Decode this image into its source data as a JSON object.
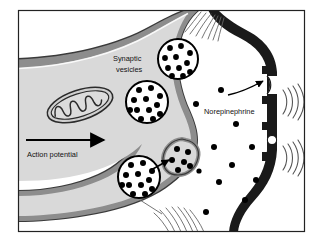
{
  "figure": {
    "panel_label": "c",
    "title_description": "Synaptic transmission at an adrenergic synapse",
    "frame": {
      "x": 18,
      "y": 10,
      "width": 287,
      "height": 222,
      "border_color": "#222222"
    },
    "background_color": "#ffffff"
  },
  "labels": {
    "synaptic_vesicles_line1": "Synaptic",
    "synaptic_vesicles_line2": "vesicles",
    "norepinephrine": "Norepinephrine",
    "action_potential": "Action potential"
  },
  "colors": {
    "cytoplasm": "#d9d9d9",
    "presynaptic_membrane": "#8d8d8d",
    "membrane_outline": "#3a3a3a",
    "postsynaptic_membrane": "#1a1a1a",
    "vesicle_fill": "#ffffff",
    "vesicle_outline": "#000000",
    "neurotransmitter_dot": "#000000",
    "cleft": "#ffffff",
    "text": "#111111"
  },
  "structures": {
    "presynaptic_terminal": {
      "name": "axon-terminal",
      "description": "Bulb-shaped presynaptic axon terminal with gray cytoplasm"
    },
    "mitochondrion": {
      "name": "mitochondrion",
      "cx": 80,
      "cy": 105,
      "rx": 34,
      "ry": 15,
      "rotation": -18,
      "cristae_count": 6
    },
    "synaptic_cleft": {
      "name": "synaptic-cleft",
      "description": "White gap between presynaptic terminal and postsynaptic membrane"
    },
    "postsynaptic_membrane": {
      "name": "postsynaptic-membrane",
      "thickness": 7,
      "receptor_count": 2
    }
  },
  "vesicles": [
    {
      "id": "vesicle-top",
      "cx": 178,
      "cy": 59,
      "r": 20,
      "granule_count": 11,
      "state": "docked-upper"
    },
    {
      "id": "vesicle-middle",
      "cx": 147,
      "cy": 102,
      "r": 21,
      "granule_count": 12,
      "state": "free"
    },
    {
      "id": "vesicle-lower",
      "cx": 139,
      "cy": 177,
      "r": 21,
      "granule_count": 12,
      "state": "free"
    },
    {
      "id": "vesicle-fusing",
      "cx": 184,
      "cy": 158,
      "r": 14,
      "granule_count": 6,
      "state": "fusing-with-membrane"
    }
  ],
  "neurotransmitter_dots": [
    {
      "cx": 196,
      "cy": 104,
      "r": 3.0
    },
    {
      "cx": 221,
      "cy": 90,
      "r": 3.0
    },
    {
      "cx": 236,
      "cy": 124,
      "r": 3.0
    },
    {
      "cx": 214,
      "cy": 147,
      "r": 3.0
    },
    {
      "cx": 252,
      "cy": 147,
      "r": 3.0
    },
    {
      "cx": 232,
      "cy": 165,
      "r": 3.0
    },
    {
      "cx": 256,
      "cy": 180,
      "r": 3.0
    },
    {
      "cx": 219,
      "cy": 182,
      "r": 3.0
    },
    {
      "cx": 245,
      "cy": 200,
      "r": 3.0
    },
    {
      "cx": 206,
      "cy": 212,
      "r": 3.0
    },
    {
      "cx": 199,
      "cy": 171,
      "r": 2.6
    }
  ],
  "receptors": [
    {
      "id": "receptor-upper",
      "cx": 275,
      "cy": 85,
      "label": "receptor-binding-site"
    },
    {
      "id": "receptor-lower",
      "cx": 275,
      "cy": 140,
      "label": "receptor-binding-site"
    }
  ],
  "signal_waves": [
    {
      "id": "wave-upper",
      "x": 288,
      "y": 98,
      "arc_count": 4
    },
    {
      "id": "wave-lower",
      "x": 288,
      "y": 152,
      "arc_count": 4
    }
  ],
  "arrows": {
    "action_potential": {
      "x1": 26,
      "y1": 140,
      "x2": 108,
      "y2": 140,
      "label_x": 27,
      "label_y": 157
    },
    "binding_arrow": {
      "description": "Curved arrow from neurotransmitter to upper receptor",
      "from_x": 231,
      "from_y": 93,
      "to_x": 266,
      "to_y": 80
    },
    "exocytosis_arrow": {
      "description": "Arrow pointing to fusing vesicle release site",
      "from_x": 153,
      "from_y": 168,
      "to_x": 170,
      "to_y": 160
    }
  },
  "hatch_groups": [
    {
      "id": "hatch-top",
      "x": 212,
      "y": 22,
      "count": 7,
      "description": "cut-edge hatching top of cleft"
    },
    {
      "id": "hatch-bottom",
      "x": 160,
      "y": 214,
      "count": 7,
      "description": "cut-edge hatching bottom of cleft"
    }
  ]
}
